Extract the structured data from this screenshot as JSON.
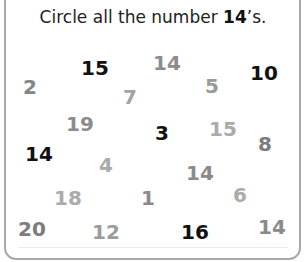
{
  "instruction": {
    "prefix": "Circle all the number ",
    "target": "14",
    "suffix": "’s."
  },
  "numbers": [
    {
      "value": "2",
      "x": 30,
      "y": 87,
      "color": "#858585"
    },
    {
      "value": "15",
      "x": 95,
      "y": 68,
      "color": "#111111"
    },
    {
      "value": "14",
      "x": 167,
      "y": 63,
      "color": "#8c8c8c"
    },
    {
      "value": "5",
      "x": 212,
      "y": 86,
      "color": "#9a9a9a"
    },
    {
      "value": "10",
      "x": 264,
      "y": 73,
      "color": "#111111"
    },
    {
      "value": "7",
      "x": 130,
      "y": 97,
      "color": "#a3a3a3"
    },
    {
      "value": "19",
      "x": 80,
      "y": 124,
      "color": "#8c8c8c"
    },
    {
      "value": "3",
      "x": 162,
      "y": 133,
      "color": "#111111"
    },
    {
      "value": "15",
      "x": 223,
      "y": 129,
      "color": "#ababab"
    },
    {
      "value": "8",
      "x": 265,
      "y": 144,
      "color": "#7c7c7c"
    },
    {
      "value": "14",
      "x": 39,
      "y": 154,
      "color": "#111111"
    },
    {
      "value": "4",
      "x": 106,
      "y": 165,
      "color": "#aaaaaa"
    },
    {
      "value": "14",
      "x": 200,
      "y": 173,
      "color": "#8a8a8a"
    },
    {
      "value": "18",
      "x": 68,
      "y": 198,
      "color": "#ababab"
    },
    {
      "value": "1",
      "x": 148,
      "y": 198,
      "color": "#8a8a8a"
    },
    {
      "value": "6",
      "x": 240,
      "y": 195,
      "color": "#ababab"
    },
    {
      "value": "20",
      "x": 32,
      "y": 229,
      "color": "#7c7c7c"
    },
    {
      "value": "12",
      "x": 106,
      "y": 232,
      "color": "#9c9c9c"
    },
    {
      "value": "16",
      "x": 195,
      "y": 232,
      "color": "#111111"
    },
    {
      "value": "14",
      "x": 272,
      "y": 227,
      "color": "#8a8a8a"
    }
  ],
  "colors": {
    "border": "#a9a9a9",
    "title": "#222222"
  }
}
